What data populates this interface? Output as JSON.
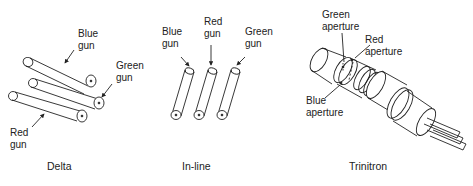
{
  "panels": [
    {
      "caption": "Delta",
      "labels": [
        {
          "line1": "Blue",
          "line2": "gun"
        },
        {
          "line1": "Green",
          "line2": "gun"
        },
        {
          "line1": "Red",
          "line2": "gun"
        }
      ]
    },
    {
      "caption": "In-line",
      "labels": [
        {
          "line1": "Blue",
          "line2": "gun"
        },
        {
          "line1": "Red",
          "line2": "gun"
        },
        {
          "line1": "Green",
          "line2": "gun"
        }
      ]
    },
    {
      "caption": "Trinitron",
      "labels": [
        {
          "line1": "Green",
          "line2": "aperture"
        },
        {
          "line1": "Red",
          "line2": "aperture"
        },
        {
          "line1": "Blue",
          "line2": "aperture"
        }
      ]
    }
  ],
  "colors": {
    "line": "#222222",
    "background": "#ffffff"
  }
}
